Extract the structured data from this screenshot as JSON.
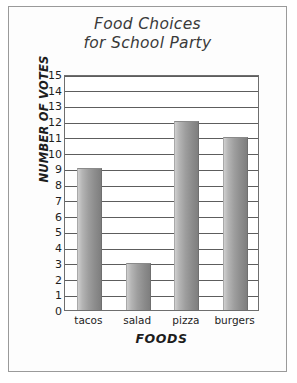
{
  "chart_data": {
    "type": "bar",
    "title": "Food Choices for School Party",
    "title_lines": [
      "Food Choices",
      "for School Party"
    ],
    "categories": [
      "tacos",
      "salad",
      "pizza",
      "burgers"
    ],
    "values": [
      9,
      3,
      12,
      11
    ],
    "xlabel": "FOODS",
    "ylabel": "NUMBER OF VOTES",
    "ylim": [
      0,
      15
    ],
    "ytick_labels": [
      "15",
      "14",
      "13",
      "12",
      "11",
      "10",
      "9",
      "8",
      "7",
      "6",
      "5",
      "4",
      "3",
      "2",
      "1",
      "0"
    ],
    "ytick_values": [
      15,
      14,
      13,
      12,
      11,
      10,
      9,
      8,
      7,
      6,
      5,
      4,
      3,
      2,
      1,
      0
    ],
    "ytick_step": 1,
    "grid": true,
    "legend": null,
    "legend_position": "none",
    "bar_color": "#9e9e9e",
    "frame_color": "#6e6e6e",
    "text_color": "#1d1d1d"
  }
}
